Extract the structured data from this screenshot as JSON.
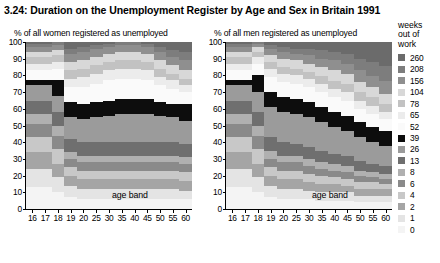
{
  "figure": {
    "title": "3.24: Duration on the Unemployment Register by Age and Sex in Britain 1991"
  },
  "panels": {
    "women": {
      "subtitle": "% of all women registered as unemployed",
      "xlabel": "age band"
    },
    "men": {
      "subtitle": "% of all men registered as unemployed",
      "xlabel": "age band"
    }
  },
  "legend": {
    "title_lines": [
      "weeks",
      "out of",
      "work"
    ],
    "entries": [
      {
        "label": "260",
        "color": "#6b6b6b"
      },
      {
        "label": "208",
        "color": "#7d7d7d"
      },
      {
        "label": "156",
        "color": "#8f8f8f"
      },
      {
        "label": "104",
        "color": "#d8d8d8"
      },
      {
        "label": "78",
        "color": "#c2c2c2"
      },
      {
        "label": "65",
        "color": "#ececec"
      },
      {
        "label": "52",
        "color": "#fafafa"
      },
      {
        "label": "39",
        "color": "#0d0d0d"
      },
      {
        "label": "26",
        "color": "#9b9b9b"
      },
      {
        "label": "13",
        "color": "#6f6f6f"
      },
      {
        "label": "8",
        "color": "#b0b0b0"
      },
      {
        "label": "6",
        "color": "#8a8a8a"
      },
      {
        "label": "4",
        "color": "#c8c8c8"
      },
      {
        "label": "2",
        "color": "#a5a5a5"
      },
      {
        "label": "1",
        "color": "#e4e4e4"
      },
      {
        "label": "0",
        "color": "#f4f4f4"
      }
    ]
  },
  "chart_data": {
    "type": "area",
    "subtype": "100% stacked area / band chart",
    "title": "3.24: Duration on the Unemployment Register by Age and Sex in Britain 1991",
    "xlabel": "age band",
    "ylabel": "% of all registered as unemployed",
    "ylim": [
      0,
      100
    ],
    "yticks": [
      0,
      10,
      20,
      30,
      40,
      50,
      60,
      70,
      80,
      90,
      100
    ],
    "grid": false,
    "legend_position": "right",
    "legend_title": "weeks out of work",
    "categories": [
      "16",
      "17",
      "18",
      "19",
      "20",
      "25",
      "30",
      "35",
      "40",
      "45",
      "50",
      "55",
      "60"
    ],
    "series_order_bottom_to_top": [
      "0",
      "1",
      "2",
      "4",
      "6",
      "8",
      "13",
      "26",
      "39",
      "52",
      "65",
      "78",
      "104",
      "156",
      "208",
      "260"
    ],
    "panels": [
      {
        "name": "women",
        "subtitle": "% of all women registered as unemployed",
        "series": [
          {
            "name": "0",
            "color": "#f4f4f4",
            "values": [
              13,
              13,
              10,
              7,
              6,
              6,
              6,
              6,
              6,
              6,
              6,
              6,
              6
            ]
          },
          {
            "name": "1",
            "color": "#e4e4e4",
            "values": [
              11,
              11,
              9,
              7,
              6,
              6,
              6,
              6,
              6,
              6,
              6,
              6,
              5
            ]
          },
          {
            "name": "2",
            "color": "#a5a5a5",
            "values": [
              10,
              10,
              8,
              6,
              6,
              6,
              6,
              6,
              6,
              6,
              6,
              6,
              6
            ]
          },
          {
            "name": "4",
            "color": "#c8c8c8",
            "values": [
              9,
              9,
              9,
              5,
              5,
              5,
              5,
              5,
              5,
              5,
              5,
              5,
              5
            ]
          },
          {
            "name": "6",
            "color": "#8a8a8a",
            "values": [
              8,
              8,
              8,
              5,
              5,
              5,
              5,
              5,
              5,
              5,
              5,
              5,
              5
            ]
          },
          {
            "name": "8",
            "color": "#b0b0b0",
            "values": [
              6,
              6,
              6,
              4,
              4,
              4,
              4,
              4,
              4,
              4,
              4,
              4,
              4
            ]
          },
          {
            "name": "13",
            "color": "#6f6f6f",
            "values": [
              8,
              8,
              8,
              8,
              8,
              8,
              8,
              8,
              8,
              8,
              8,
              8,
              8
            ]
          },
          {
            "name": "26",
            "color": "#9b9b9b",
            "values": [
              9,
              9,
              10,
              13,
              14,
              15,
              16,
              17,
              17,
              17,
              16,
              15,
              14
            ]
          },
          {
            "name": "39",
            "color": "#0d0d0d",
            "values": [
              3,
              3,
              9,
              9,
              9,
              9,
              9,
              9,
              9,
              9,
              8,
              8,
              10
            ]
          },
          {
            "name": "52",
            "color": "#fafafa",
            "values": [
              6,
              6,
              7,
              9,
              10,
              11,
              12,
              12,
              12,
              11,
              10,
              9,
              7
            ]
          },
          {
            "name": "65",
            "color": "#ececec",
            "values": [
              4,
              4,
              4,
              5,
              6,
              6,
              6,
              6,
              6,
              6,
              5,
              5,
              4
            ]
          },
          {
            "name": "78",
            "color": "#c2c2c2",
            "values": [
              4,
              4,
              4,
              5,
              5,
              5,
              5,
              5,
              5,
              5,
              5,
              4,
              4
            ]
          },
          {
            "name": "104",
            "color": "#d8d8d8",
            "values": [
              3,
              3,
              3,
              5,
              5,
              5,
              5,
              5,
              5,
              5,
              5,
              5,
              5
            ]
          },
          {
            "name": "156",
            "color": "#8f8f8f",
            "values": [
              3,
              3,
              3,
              5,
              5,
              5,
              4,
              4,
              4,
              4,
              5,
              5,
              6
            ]
          },
          {
            "name": "208",
            "color": "#7d7d7d",
            "values": [
              2,
              2,
              2,
              3,
              3,
              2,
              2,
              2,
              2,
              2,
              3,
              4,
              5
            ]
          },
          {
            "name": "260",
            "color": "#6b6b6b",
            "values": [
              1,
              1,
              0,
              4,
              3,
              2,
              1,
              0,
              0,
              1,
              3,
              5,
              6
            ]
          }
        ]
      },
      {
        "name": "men",
        "subtitle": "% of all men registered as unemployed",
        "series": [
          {
            "name": "0",
            "color": "#f4f4f4",
            "values": [
              13,
              13,
              10,
              7,
              6,
              6,
              6,
              5,
              5,
              5,
              4,
              4,
              4
            ]
          },
          {
            "name": "1",
            "color": "#e4e4e4",
            "values": [
              11,
              11,
              9,
              7,
              6,
              6,
              5,
              5,
              5,
              5,
              4,
              4,
              4
            ]
          },
          {
            "name": "2",
            "color": "#a5a5a5",
            "values": [
              10,
              10,
              8,
              6,
              6,
              6,
              5,
              5,
              5,
              4,
              4,
              4,
              4
            ]
          },
          {
            "name": "4",
            "color": "#c8c8c8",
            "values": [
              9,
              9,
              9,
              5,
              5,
              5,
              5,
              5,
              4,
              4,
              4,
              4,
              3
            ]
          },
          {
            "name": "6",
            "color": "#8a8a8a",
            "values": [
              8,
              8,
              8,
              5,
              5,
              5,
              5,
              4,
              4,
              4,
              4,
              3,
              3
            ]
          },
          {
            "name": "8",
            "color": "#b0b0b0",
            "values": [
              6,
              6,
              6,
              5,
              4,
              4,
              4,
              4,
              4,
              4,
              3,
              3,
              3
            ]
          },
          {
            "name": "13",
            "color": "#6f6f6f",
            "values": [
              8,
              8,
              8,
              8,
              8,
              7,
              7,
              7,
              6,
              6,
              6,
              5,
              5
            ]
          },
          {
            "name": "26",
            "color": "#9b9b9b",
            "values": [
              9,
              9,
              12,
              18,
              18,
              18,
              18,
              17,
              16,
              15,
              14,
              13,
              12
            ]
          },
          {
            "name": "39",
            "color": "#0d0d0d",
            "values": [
              3,
              3,
              10,
              9,
              9,
              9,
              9,
              9,
              9,
              9,
              9,
              9,
              9
            ]
          },
          {
            "name": "52",
            "color": "#fafafa",
            "values": [
              6,
              6,
              7,
              9,
              9,
              9,
              9,
              9,
              9,
              9,
              8,
              8,
              7
            ]
          },
          {
            "name": "65",
            "color": "#ececec",
            "values": [
              4,
              4,
              4,
              5,
              5,
              5,
              5,
              5,
              5,
              5,
              5,
              5,
              4
            ]
          },
          {
            "name": "78",
            "color": "#c2c2c2",
            "values": [
              4,
              4,
              3,
              4,
              4,
              4,
              4,
              5,
              5,
              5,
              5,
              5,
              5
            ]
          },
          {
            "name": "104",
            "color": "#d8d8d8",
            "values": [
              3,
              3,
              3,
              4,
              5,
              5,
              5,
              5,
              6,
              6,
              6,
              6,
              6
            ]
          },
          {
            "name": "156",
            "color": "#8f8f8f",
            "values": [
              3,
              3,
              2,
              4,
              4,
              4,
              5,
              5,
              6,
              6,
              7,
              7,
              8
            ]
          },
          {
            "name": "208",
            "color": "#7d7d7d",
            "values": [
              2,
              2,
              1,
              2,
              3,
              3,
              4,
              5,
              5,
              6,
              7,
              8,
              9
            ]
          },
          {
            "name": "260",
            "color": "#6b6b6b",
            "values": [
              1,
              1,
              0,
              2,
              3,
              4,
              4,
              5,
              6,
              7,
              10,
              12,
              14
            ]
          }
        ]
      }
    ]
  }
}
